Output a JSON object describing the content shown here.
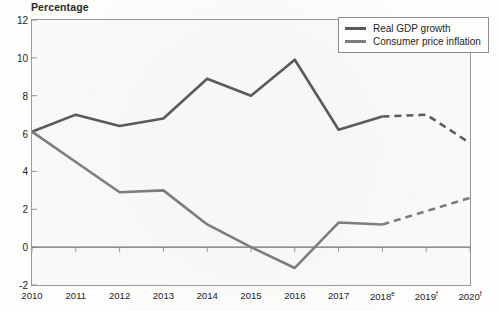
{
  "chart_data": {
    "type": "line",
    "title": "Percentage",
    "xlabel": "",
    "ylabel": "Percentage",
    "ylim": [
      -2,
      12
    ],
    "yticks": [
      -2,
      0,
      2,
      4,
      6,
      8,
      10,
      12
    ],
    "grid": false,
    "legend_position": "top-right",
    "zero_line": true,
    "categories": [
      "2010",
      "2011",
      "2012",
      "2013",
      "2014",
      "2015",
      "2016",
      "2017",
      "2018e",
      "2019f",
      "2020f"
    ],
    "tick_labels": [
      {
        "base": "2010",
        "sup": ""
      },
      {
        "base": "2011",
        "sup": ""
      },
      {
        "base": "2012",
        "sup": ""
      },
      {
        "base": "2013",
        "sup": ""
      },
      {
        "base": "2014",
        "sup": ""
      },
      {
        "base": "2015",
        "sup": ""
      },
      {
        "base": "2016",
        "sup": ""
      },
      {
        "base": "2017",
        "sup": ""
      },
      {
        "base": "2018",
        "sup": "e"
      },
      {
        "base": "2019",
        "sup": "f"
      },
      {
        "base": "2020",
        "sup": "f"
      }
    ],
    "forecast_starts_at": "2018e",
    "series": [
      {
        "name": "Real GDP growth",
        "color": "#5a5a5a",
        "values": [
          6.1,
          7.0,
          6.4,
          6.8,
          8.9,
          8.0,
          9.9,
          6.2,
          6.9,
          7.0,
          5.5
        ],
        "solid_through_index": 8
      },
      {
        "name": "Consumer price inflation",
        "color": "#7d7d7d",
        "values": [
          6.1,
          4.5,
          2.9,
          3.0,
          1.2,
          0.0,
          -1.1,
          1.3,
          1.2,
          1.9,
          2.6
        ],
        "solid_through_index": 8
      }
    ]
  },
  "legend": {
    "items": [
      {
        "label": "Real GDP growth",
        "color": "#5a5a5a"
      },
      {
        "label": "Consumer price inflation",
        "color": "#7d7d7d"
      }
    ]
  }
}
